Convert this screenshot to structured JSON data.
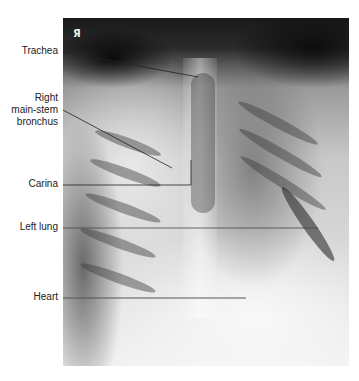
{
  "figure": {
    "type": "labeled chest radiograph",
    "orientation_marker": "Я",
    "labels": [
      {
        "id": "trachea",
        "text": "Trachea"
      },
      {
        "id": "right-main-stem-bronchus",
        "line1": "Right",
        "line2": "main-stem",
        "line3": "bronchus"
      },
      {
        "id": "carina",
        "text": "Carina"
      },
      {
        "id": "left-lung",
        "text": "Left lung"
      },
      {
        "id": "heart",
        "text": "Heart"
      }
    ]
  }
}
